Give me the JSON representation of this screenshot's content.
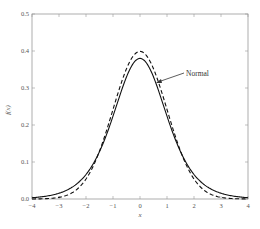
{
  "chart_data": {
    "type": "line",
    "title": "",
    "xlabel": "x",
    "ylabel": "f(x)",
    "xlim": [
      -4,
      4
    ],
    "ylim": [
      0,
      0.5
    ],
    "grid": false,
    "x_ticks": [
      "-4",
      "-3",
      "-2",
      "-1",
      "0",
      "1",
      "2",
      "3",
      "4"
    ],
    "y_ticks": [
      "0.0",
      "0.1",
      "0.2",
      "0.3",
      "0.4",
      "0.5"
    ],
    "series": [
      {
        "name": "Normal",
        "style": "dashed",
        "x": [
          -4,
          -3,
          -2,
          -1.5,
          -1,
          -0.5,
          0,
          0.5,
          1,
          1.5,
          2,
          3,
          4
        ],
        "values": [
          0.0001,
          0.0044,
          0.054,
          0.1295,
          0.242,
          0.352,
          0.399,
          0.352,
          0.242,
          0.1295,
          0.054,
          0.0044,
          0.0001
        ]
      },
      {
        "name": "Heavier-tailed density",
        "style": "solid",
        "x": [
          -4,
          -3,
          -2,
          -1.5,
          -1,
          -0.5,
          0,
          0.5,
          1,
          1.5,
          2,
          3,
          4
        ],
        "values": [
          0.009,
          0.025,
          0.063,
          0.118,
          0.21,
          0.33,
          0.38,
          0.33,
          0.21,
          0.118,
          0.063,
          0.025,
          0.009
        ]
      }
    ],
    "annotations": [
      {
        "text": "Normal",
        "points_to_series": "Normal",
        "arrow_target": [
          0.7,
          0.32
        ]
      }
    ]
  }
}
